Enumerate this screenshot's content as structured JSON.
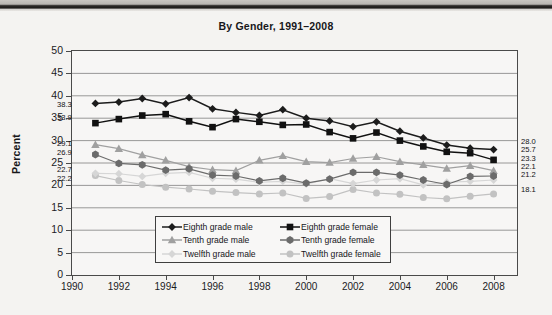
{
  "chart_data": {
    "type": "line",
    "title": "By Gender, 1991–2008",
    "xlabel": "",
    "ylabel": "Percent",
    "xlim": [
      1990,
      2009
    ],
    "ylim": [
      0,
      50
    ],
    "grid": "horizontal",
    "legend_position": "bottom-center",
    "x": [
      1991,
      1992,
      1993,
      1994,
      1995,
      1996,
      1997,
      1998,
      1999,
      2000,
      2001,
      2002,
      2003,
      2004,
      2005,
      2006,
      2007,
      2008
    ],
    "xticks": [
      "1990",
      "1992",
      "1994",
      "1996",
      "1998",
      "2000",
      "2002",
      "2004",
      "2006",
      "2008"
    ],
    "yticks": [
      "0",
      "5",
      "10",
      "15",
      "20",
      "25",
      "30",
      "35",
      "40",
      "45",
      "50"
    ],
    "series": [
      {
        "name": "Eighth grade male",
        "marker": "diamond",
        "color": "#1c1c1c",
        "start_label": "38.3",
        "end_label": "28.0",
        "values": [
          38.3,
          38.6,
          39.4,
          38.2,
          39.6,
          37.1,
          36.3,
          35.6,
          36.9,
          35.0,
          34.4,
          33.1,
          34.2,
          32.1,
          30.6,
          29.0,
          28.3,
          28.0
        ]
      },
      {
        "name": "Eighth grade female",
        "marker": "square",
        "color": "#111111",
        "start_label": "33.9",
        "end_label": "25.7",
        "values": [
          33.9,
          34.8,
          35.6,
          35.9,
          34.3,
          33.0,
          34.8,
          34.2,
          33.5,
          33.6,
          31.9,
          30.5,
          31.8,
          30.0,
          28.7,
          27.5,
          27.2,
          25.7
        ]
      },
      {
        "name": "Tenth grade male",
        "marker": "triangle",
        "color": "#a0a0a0",
        "start_label": "29.1",
        "end_label": "23.3",
        "values": [
          29.1,
          28.2,
          26.8,
          25.6,
          24.2,
          23.5,
          23.3,
          25.6,
          26.6,
          25.3,
          25.1,
          26.0,
          26.4,
          25.3,
          24.6,
          23.8,
          24.4,
          23.3
        ]
      },
      {
        "name": "Tenth grade female",
        "marker": "hexagon",
        "color": "#6b6b6b",
        "start_label": "26.9",
        "end_label": "22.1",
        "values": [
          26.9,
          24.9,
          24.6,
          23.4,
          23.7,
          22.3,
          22.1,
          21.0,
          21.6,
          20.5,
          21.4,
          22.9,
          22.9,
          22.3,
          21.2,
          20.2,
          22.0,
          22.1
        ]
      },
      {
        "name": "Twelfth grade male",
        "marker": "diamond-light",
        "color": "#d6d6d6",
        "start_label": "22.7",
        "end_label": "21.2",
        "values": [
          22.7,
          22.6,
          22.0,
          22.7,
          22.9,
          21.6,
          21.4,
          20.7,
          20.9,
          20.3,
          21.5,
          20.4,
          21.2,
          21.5,
          20.1,
          20.7,
          20.9,
          21.2
        ]
      },
      {
        "name": "Twelfth grade female",
        "marker": "circle-light",
        "color": "#c2c2c2",
        "start_label": "22.2",
        "end_label": "18.1",
        "values": [
          22.2,
          21.1,
          20.2,
          19.6,
          19.2,
          18.7,
          18.4,
          18.1,
          18.3,
          17.1,
          17.5,
          19.1,
          18.3,
          18.0,
          17.3,
          17.0,
          17.6,
          18.1
        ]
      }
    ]
  },
  "legend": {
    "columns": [
      [
        "Eighth grade male",
        "Tenth grade male",
        "Twelfth grade male"
      ],
      [
        "Eighth grade female",
        "Tenth grade female",
        "Twelfth grade female"
      ]
    ]
  }
}
